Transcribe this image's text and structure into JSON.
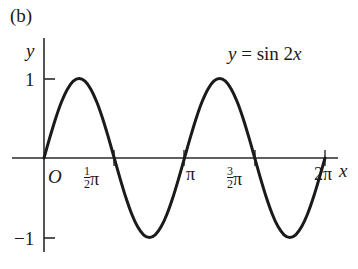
{
  "figure": {
    "panel_label": "(b)",
    "equation": {
      "lhs": "y",
      "eq": " = sin 2",
      "rhs": "x",
      "full": "y = sin 2x"
    },
    "axis_labels": {
      "x": "x",
      "y": "y"
    },
    "origin_label": "O"
  },
  "chart_data": {
    "type": "line",
    "title": "(b)",
    "annotations": [
      "y = sin 2x"
    ],
    "xlabel": "x",
    "ylabel": "y",
    "xlim": [
      0,
      6.283185307179586
    ],
    "ylim": [
      -1.35,
      1.35
    ],
    "grid": false,
    "legend": "none",
    "xticks": [
      {
        "value": 0,
        "label": "O"
      },
      {
        "value": 1.5707963,
        "label": "1/2 pi",
        "num": "1",
        "den": "2",
        "pi": "π"
      },
      {
        "value": 3.1415927,
        "label": "pi",
        "pi": "π"
      },
      {
        "value": 4.712389,
        "label": "3/2 pi",
        "num": "3",
        "den": "2",
        "pi": "π"
      },
      {
        "value": 6.2831853,
        "label": "2 pi",
        "lead": "2",
        "pi": "π"
      }
    ],
    "yticks": [
      {
        "value": 1,
        "label": "1"
      },
      {
        "value": -1,
        "label": "−1"
      }
    ],
    "series": [
      {
        "name": "y = sin 2x",
        "color": "#1a1a1a",
        "linewidth": 3,
        "x": [
          0.0,
          0.1309,
          0.2618,
          0.3927,
          0.5236,
          0.6545,
          0.7854,
          0.9163,
          1.0472,
          1.1781,
          1.309,
          1.4399,
          1.5708,
          1.7017,
          1.8326,
          1.9635,
          2.0944,
          2.2253,
          2.3562,
          2.4871,
          2.618,
          2.7489,
          2.8798,
          3.0107,
          3.1416,
          3.2725,
          3.4034,
          3.5343,
          3.6652,
          3.7961,
          3.927,
          4.0579,
          4.1888,
          4.3197,
          4.4506,
          4.5815,
          4.7124,
          4.8433,
          4.9742,
          5.1051,
          5.236,
          5.3669,
          5.4978,
          5.6287,
          5.7596,
          5.8905,
          6.0214,
          6.1523,
          6.2832
        ],
        "y": [
          0.0,
          0.2588,
          0.5,
          0.7071,
          0.866,
          0.9659,
          1.0,
          0.9659,
          0.866,
          0.7071,
          0.5,
          0.2588,
          0.0,
          -0.2588,
          -0.5,
          -0.7071,
          -0.866,
          -0.9659,
          -1.0,
          -0.9659,
          -0.866,
          -0.7071,
          -0.5,
          -0.2588,
          0.0,
          0.2588,
          0.5,
          0.7071,
          0.866,
          0.9659,
          1.0,
          0.9659,
          0.866,
          0.7071,
          0.5,
          0.2588,
          0.0,
          -0.2588,
          -0.5,
          -0.7071,
          -0.866,
          -0.9659,
          -1.0,
          -0.9659,
          -0.866,
          -0.7071,
          -0.5,
          -0.2588,
          0.0
        ]
      }
    ]
  },
  "geometry": {
    "origin_x": 44,
    "origin_y": 158,
    "x_scale": 44.72,
    "y_scale": 79.5,
    "axis_color": "#2a2a2a",
    "x_axis_start": 12,
    "x_axis_end": 338,
    "y_axis_top": 38,
    "y_axis_bottom": 252
  }
}
